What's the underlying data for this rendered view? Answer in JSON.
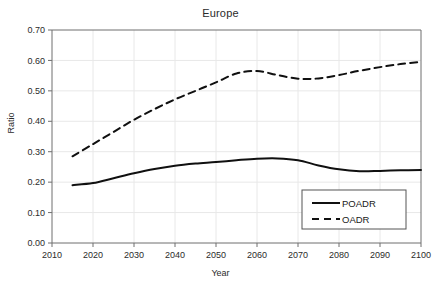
{
  "chart_data": {
    "type": "line",
    "title": "Europe",
    "xlabel": "Year",
    "ylabel": "Ratio",
    "xlim": [
      2010,
      2100
    ],
    "ylim": [
      0.0,
      0.7
    ],
    "xticks": [
      2010,
      2020,
      2030,
      2040,
      2050,
      2060,
      2070,
      2080,
      2090,
      2100
    ],
    "xtick_labels": [
      "2010",
      "2020",
      "2030",
      "2040",
      "2050",
      "2060",
      "2070",
      "2080",
      "2090",
      "2100"
    ],
    "yticks": [
      0.0,
      0.1,
      0.2,
      0.3,
      0.4,
      0.5,
      0.6,
      0.7
    ],
    "ytick_labels": [
      "0.00",
      "0.10",
      "0.20",
      "0.30",
      "0.40",
      "0.50",
      "0.60",
      "0.70"
    ],
    "grid": true,
    "legend_position": "lower right",
    "line_color": "#101010",
    "grid_color": "#e8e8e8",
    "axis_color": "#6f6f6f",
    "series": [
      {
        "name": "POADR",
        "style": "solid",
        "x": [
          2015,
          2020,
          2025,
          2030,
          2035,
          2040,
          2045,
          2050,
          2055,
          2060,
          2065,
          2070,
          2075,
          2080,
          2085,
          2090,
          2095,
          2100
        ],
        "values": [
          0.19,
          0.197,
          0.213,
          0.229,
          0.243,
          0.254,
          0.261,
          0.266,
          0.272,
          0.277,
          0.278,
          0.272,
          0.255,
          0.242,
          0.236,
          0.237,
          0.239,
          0.24
        ]
      },
      {
        "name": "OADR",
        "style": "dashed",
        "x": [
          2015,
          2020,
          2025,
          2030,
          2035,
          2040,
          2045,
          2050,
          2055,
          2060,
          2065,
          2070,
          2075,
          2080,
          2085,
          2090,
          2095,
          2100
        ],
        "values": [
          0.285,
          0.325,
          0.365,
          0.405,
          0.44,
          0.472,
          0.5,
          0.528,
          0.557,
          0.565,
          0.552,
          0.54,
          0.541,
          0.552,
          0.566,
          0.578,
          0.588,
          0.595
        ]
      }
    ]
  },
  "legend": {
    "entries": [
      {
        "label": "POADR",
        "style": "solid"
      },
      {
        "label": "OADR",
        "style": "dashed"
      }
    ]
  }
}
